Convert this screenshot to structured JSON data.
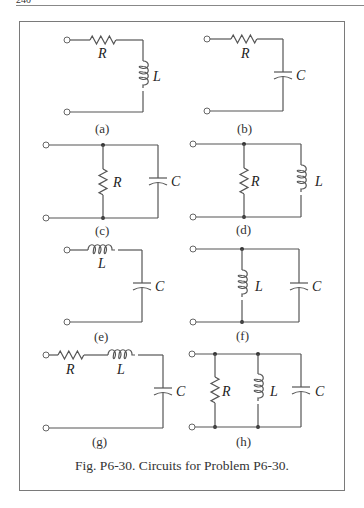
{
  "page": {
    "header_fragment": "240"
  },
  "figure": {
    "caption": "Fig. P6-30. Circuits for Problem P6-30.",
    "circuits": [
      {
        "id": "a",
        "label": "(a)",
        "topology": "series",
        "components": [
          {
            "type": "resistor",
            "symbol": "R"
          },
          {
            "type": "inductor",
            "symbol": "L"
          }
        ]
      },
      {
        "id": "b",
        "label": "(b)",
        "topology": "series",
        "components": [
          {
            "type": "resistor",
            "symbol": "R"
          },
          {
            "type": "capacitor",
            "symbol": "C"
          }
        ]
      },
      {
        "id": "c",
        "label": "(c)",
        "topology": "parallel",
        "components": [
          {
            "type": "resistor",
            "symbol": "R"
          },
          {
            "type": "capacitor",
            "symbol": "C"
          }
        ]
      },
      {
        "id": "d",
        "label": "(d)",
        "topology": "parallel",
        "components": [
          {
            "type": "resistor",
            "symbol": "R"
          },
          {
            "type": "inductor",
            "symbol": "L"
          }
        ]
      },
      {
        "id": "e",
        "label": "(e)",
        "topology": "series",
        "components": [
          {
            "type": "inductor",
            "symbol": "L"
          },
          {
            "type": "capacitor",
            "symbol": "C"
          }
        ]
      },
      {
        "id": "f",
        "label": "(f)",
        "topology": "parallel",
        "components": [
          {
            "type": "inductor",
            "symbol": "L"
          },
          {
            "type": "capacitor",
            "symbol": "C"
          }
        ]
      },
      {
        "id": "g",
        "label": "(g)",
        "topology": "series",
        "components": [
          {
            "type": "resistor",
            "symbol": "R"
          },
          {
            "type": "inductor",
            "symbol": "L"
          },
          {
            "type": "capacitor",
            "symbol": "C"
          }
        ]
      },
      {
        "id": "h",
        "label": "(h)",
        "topology": "parallel",
        "components": [
          {
            "type": "resistor",
            "symbol": "R"
          },
          {
            "type": "inductor",
            "symbol": "L"
          },
          {
            "type": "capacitor",
            "symbol": "C"
          }
        ]
      }
    ]
  }
}
